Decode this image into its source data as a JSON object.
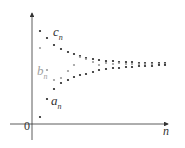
{
  "figure": {
    "origin_label": "0",
    "x_axis_label": "n",
    "series_labels": {
      "c": {
        "main": "c",
        "sub": "n"
      },
      "b": {
        "main": "b",
        "sub": "n"
      },
      "a": {
        "main": "a",
        "sub": "n"
      }
    },
    "colors": {
      "axis": "#333333",
      "dark_points": "#222222",
      "gray_points": "#9a9a9a",
      "label_dark": "#333333",
      "label_gray": "#a0a0a0"
    }
  },
  "chart_data": {
    "type": "scatter",
    "title": "",
    "xlabel": "n",
    "ylabel": "",
    "series": [
      {
        "name": "c_n",
        "color": "#222222",
        "points": [
          [
            40,
            31
          ],
          [
            47,
            38
          ],
          [
            54,
            45
          ],
          [
            61,
            49
          ],
          [
            68,
            52
          ],
          [
            74,
            54
          ],
          [
            80,
            56
          ],
          [
            86,
            58
          ],
          [
            93,
            59
          ],
          [
            99,
            60
          ],
          [
            106,
            61
          ],
          [
            113,
            61
          ],
          [
            119,
            62
          ],
          [
            126,
            62
          ],
          [
            132,
            62
          ],
          [
            139,
            63
          ],
          [
            145,
            63
          ],
          [
            152,
            63
          ],
          [
            159,
            63
          ],
          [
            165,
            63
          ]
        ]
      },
      {
        "name": "b_n",
        "color": "#9a9a9a",
        "points": [
          [
            40,
            48
          ],
          [
            47,
            70
          ],
          [
            54,
            80
          ],
          [
            61,
            78
          ],
          [
            68,
            71
          ],
          [
            74,
            65
          ],
          [
            80,
            57
          ],
          [
            86,
            59
          ],
          [
            93,
            62
          ],
          [
            99,
            65
          ],
          [
            106,
            63
          ],
          [
            113,
            64
          ],
          [
            119,
            63
          ],
          [
            126,
            64
          ],
          [
            132,
            64
          ],
          [
            139,
            64
          ],
          [
            145,
            64
          ],
          [
            152,
            64
          ],
          [
            159,
            64
          ],
          [
            165,
            64
          ]
        ]
      },
      {
        "name": "a_n",
        "color": "#222222",
        "points": [
          [
            40,
            117
          ],
          [
            47,
            99
          ],
          [
            54,
            89
          ],
          [
            61,
            83
          ],
          [
            68,
            80
          ],
          [
            74,
            77
          ],
          [
            80,
            75
          ],
          [
            86,
            74
          ],
          [
            93,
            72
          ],
          [
            99,
            70
          ],
          [
            106,
            69
          ],
          [
            113,
            68
          ],
          [
            119,
            68
          ],
          [
            126,
            67
          ],
          [
            132,
            67
          ],
          [
            139,
            66
          ],
          [
            145,
            66
          ],
          [
            152,
            66
          ],
          [
            159,
            65
          ],
          [
            165,
            65
          ]
        ]
      }
    ],
    "grid": false,
    "legend": "inline labels"
  }
}
